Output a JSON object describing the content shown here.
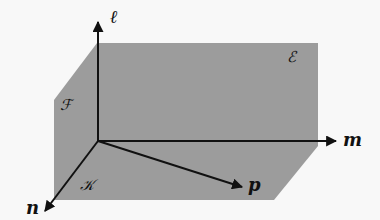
{
  "diagram": {
    "colors": {
      "background": "#f8f8f8",
      "plane_fill": "#9c9c9c",
      "line": "#111111"
    },
    "axes": [
      {
        "id": "l",
        "label": "ℓ",
        "direction": "up"
      },
      {
        "id": "m",
        "label": "m",
        "direction": "right"
      },
      {
        "id": "n",
        "label": "n",
        "direction": "down-left"
      },
      {
        "id": "p",
        "label": "p",
        "direction": "down-right"
      }
    ],
    "planes": [
      {
        "id": "E",
        "label": "ℰ"
      },
      {
        "id": "F",
        "label": "ℱ"
      },
      {
        "id": "K",
        "label": "𝒦"
      }
    ]
  }
}
